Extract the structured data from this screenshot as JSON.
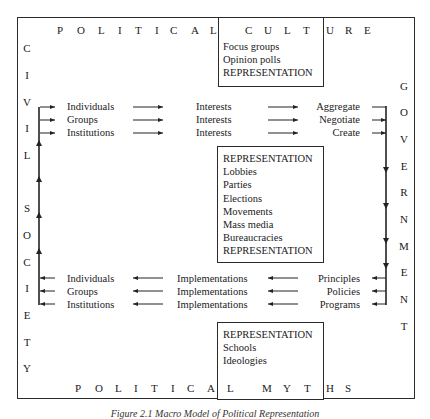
{
  "diagram": {
    "caption": "Figure 2.1 Macro Model of Political Representation",
    "top_label": [
      "P",
      "O",
      "L",
      "I",
      "T",
      "I",
      "C",
      "A",
      "L",
      "C",
      "U",
      "L",
      "T",
      "U",
      "R",
      "E"
    ],
    "bottom_label": [
      "P",
      "O",
      "L",
      "I",
      "T",
      "I",
      "C",
      "A",
      "L",
      "M",
      "Y",
      "T",
      "H",
      "S"
    ],
    "left_label": [
      "C",
      "I",
      "V",
      "I",
      "L",
      "S",
      "O",
      "C",
      "I",
      "E",
      "T",
      "Y"
    ],
    "right_label": [
      "G",
      "O",
      "V",
      "E",
      "R",
      "N",
      "M",
      "E",
      "N",
      "T"
    ],
    "top_box": [
      "Focus groups",
      "Opinion polls",
      "REPRESENTATION"
    ],
    "middle_box": [
      "REPRESENTATION",
      "Lobbies",
      "Parties",
      "Elections",
      "Movements",
      "Mass media",
      "Bureaucracies",
      "REPRESENTATION"
    ],
    "bottom_box": [
      "REPRESENTATION",
      "Schools",
      "Ideologies"
    ],
    "input_rows": [
      {
        "source": "Individuals",
        "middle": "Interests",
        "target": "Aggregate"
      },
      {
        "source": "Groups",
        "middle": "Interests",
        "target": "Negotiate"
      },
      {
        "source": "Institutions",
        "middle": "Interests",
        "target": "Create"
      }
    ],
    "output_rows": [
      {
        "target": "Individuals",
        "middle": "Implementations",
        "source": "Principles"
      },
      {
        "target": "Groups",
        "middle": "Implementations",
        "source": "Policies"
      },
      {
        "target": "Institutions",
        "middle": "Implementations",
        "source": "Programs"
      }
    ]
  }
}
